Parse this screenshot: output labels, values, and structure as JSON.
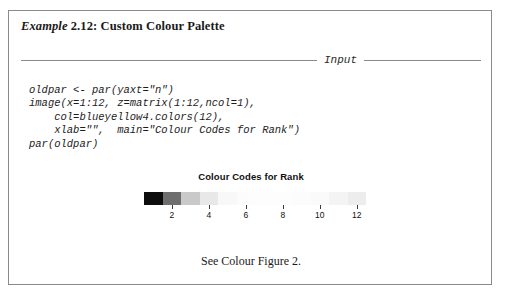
{
  "example": {
    "keyword": "Example",
    "number": "2.12:",
    "title": "Custom Colour Palette",
    "full_title": "Example 2.12: Custom Colour Palette"
  },
  "section": {
    "input_label": "Input"
  },
  "code": {
    "text": "oldpar <- par(yaxt=\"n\")\nimage(x=1:12, z=matrix(1:12,ncol=1),\n    col=blueyellow4.colors(12),\n    xlab=\"\",  main=\"Colour Codes for Rank\")\npar(oldpar)"
  },
  "caption": {
    "text": "See Colour Figure 2."
  },
  "chart_data": {
    "type": "heatmap",
    "title": "Colour Codes for Rank",
    "xlabel": "",
    "ylabel": "",
    "x": [
      1,
      2,
      3,
      4,
      5,
      6,
      7,
      8,
      9,
      10,
      11,
      12
    ],
    "values": [
      1,
      2,
      3,
      4,
      5,
      6,
      7,
      8,
      9,
      10,
      11,
      12
    ],
    "n_cells": 12,
    "xlim": [
      0.5,
      12.5
    ],
    "tick_values": [
      2,
      4,
      6,
      8,
      10,
      12
    ],
    "tick_labels": [
      "2",
      "4",
      "6",
      "8",
      "10",
      "12"
    ],
    "yaxis_visible": false,
    "grid": false,
    "legend": "none",
    "colors": [
      "#0d0d0d",
      "#6e6e6e",
      "#c9c9c9",
      "#e8e8e8",
      "#f8f8f8",
      "#fcfcfc",
      "#fdfdfd",
      "#fdfdfd",
      "#fcfcfc",
      "#fafafa",
      "#f4f4f4",
      "#ededed"
    ]
  }
}
